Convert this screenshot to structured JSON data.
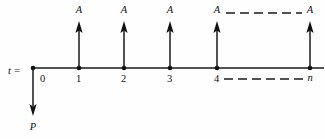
{
  "diagram": {
    "kind": "cash-flow-timeline",
    "time_axis_label": "t =",
    "present_value_label": "P",
    "annuity_label": "A",
    "terminal_period_label": "n",
    "colors": {
      "ink": "#111111",
      "background": "#fefefe"
    },
    "axis": {
      "y": 68,
      "x_start": 33,
      "x_end": 324,
      "continuation_dashed": true
    },
    "periods": [
      {
        "label": "0",
        "x": 33,
        "has_inflow": false,
        "has_outflow": true
      },
      {
        "label": "1",
        "x": 79,
        "has_inflow": true,
        "has_outflow": false
      },
      {
        "label": "2",
        "x": 124,
        "has_inflow": true,
        "has_outflow": false
      },
      {
        "label": "3",
        "x": 170,
        "has_inflow": true,
        "has_outflow": false
      },
      {
        "label": "4",
        "x": 217,
        "has_inflow": true,
        "has_outflow": false
      },
      {
        "label": "n",
        "x": 310,
        "has_inflow": true,
        "has_outflow": false
      }
    ],
    "inflow_arrows": [
      {
        "period": "1",
        "x": 79,
        "amount_label": "A",
        "label_x": 79,
        "label_y": 13
      },
      {
        "period": "2",
        "x": 124,
        "amount_label": "A",
        "label_x": 124,
        "label_y": 13
      },
      {
        "period": "3",
        "x": 170,
        "amount_label": "A",
        "label_x": 170,
        "label_y": 13
      },
      {
        "period": "4",
        "x": 217,
        "amount_label": "A",
        "label_x": 217,
        "label_y": 13
      },
      {
        "period": "n",
        "x": 310,
        "amount_label": "A",
        "label_x": 310,
        "label_y": 13
      }
    ],
    "outflow_arrow": {
      "period": "0",
      "x": 33,
      "amount_label": "P",
      "label_x": 33,
      "label_y": 128,
      "tip_y": 116
    },
    "dashed_connectors": [
      {
        "name": "upper-ellipsis",
        "x1": 226,
        "x2": 302,
        "y": 13
      },
      {
        "name": "lower-ellipsis",
        "x1": 224,
        "x2": 303,
        "y": 79
      }
    ],
    "tick_labels": [
      {
        "text": "0",
        "x": 40,
        "y": 82
      },
      {
        "text": "1",
        "x": 76,
        "y": 82
      },
      {
        "text": "2",
        "x": 121,
        "y": 82
      },
      {
        "text": "3",
        "x": 167,
        "y": 82
      },
      {
        "text": "4",
        "x": 214,
        "y": 82
      },
      {
        "text": "n",
        "x": 310,
        "y": 81
      }
    ],
    "axis_label_pos": {
      "x": 8,
      "y": 74
    }
  }
}
